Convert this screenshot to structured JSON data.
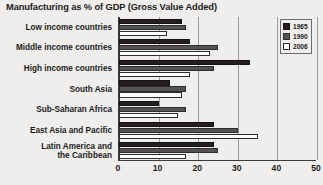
{
  "chart_data": {
    "type": "bar",
    "orientation": "horizontal",
    "title": "Manufacturing as % of GDP (Gross Value Added)",
    "xlabel": "",
    "ylabel": "",
    "xlim": [
      0,
      50
    ],
    "xticks": [
      0,
      10,
      20,
      30,
      40,
      50
    ],
    "grid": true,
    "legend_position": "top-right",
    "categories": [
      "Low income countries",
      "Middle income countries",
      "High income countries",
      "South Asia",
      "Sub-Saharan Africa",
      "East Asia and Pacific",
      "Latin America and\nthe Caribbean"
    ],
    "series": [
      {
        "name": "1965",
        "color": "#231f20",
        "values": [
          16,
          18,
          33,
          13,
          10,
          24,
          24
        ]
      },
      {
        "name": "1990",
        "color": "#555254",
        "values": [
          17,
          25,
          24,
          17,
          17,
          30,
          25
        ]
      },
      {
        "name": "2006",
        "color": "#ffffff",
        "values": [
          12,
          23,
          18,
          16,
          15,
          35,
          17
        ]
      }
    ]
  },
  "legend": {
    "items": [
      {
        "label": "1965"
      },
      {
        "label": "1990"
      },
      {
        "label": "2006"
      }
    ]
  }
}
